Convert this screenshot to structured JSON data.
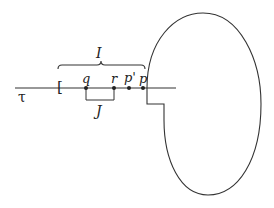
{
  "diagram": {
    "labels": {
      "tau": "τ",
      "bracket_open": "[",
      "interval_I": "I",
      "interval_J": "J",
      "point_q": "q",
      "point_r": "r",
      "point_p_prime": "p'",
      "point_p": "p"
    },
    "colors": {
      "stroke": "#333333",
      "background": "#ffffff"
    }
  }
}
